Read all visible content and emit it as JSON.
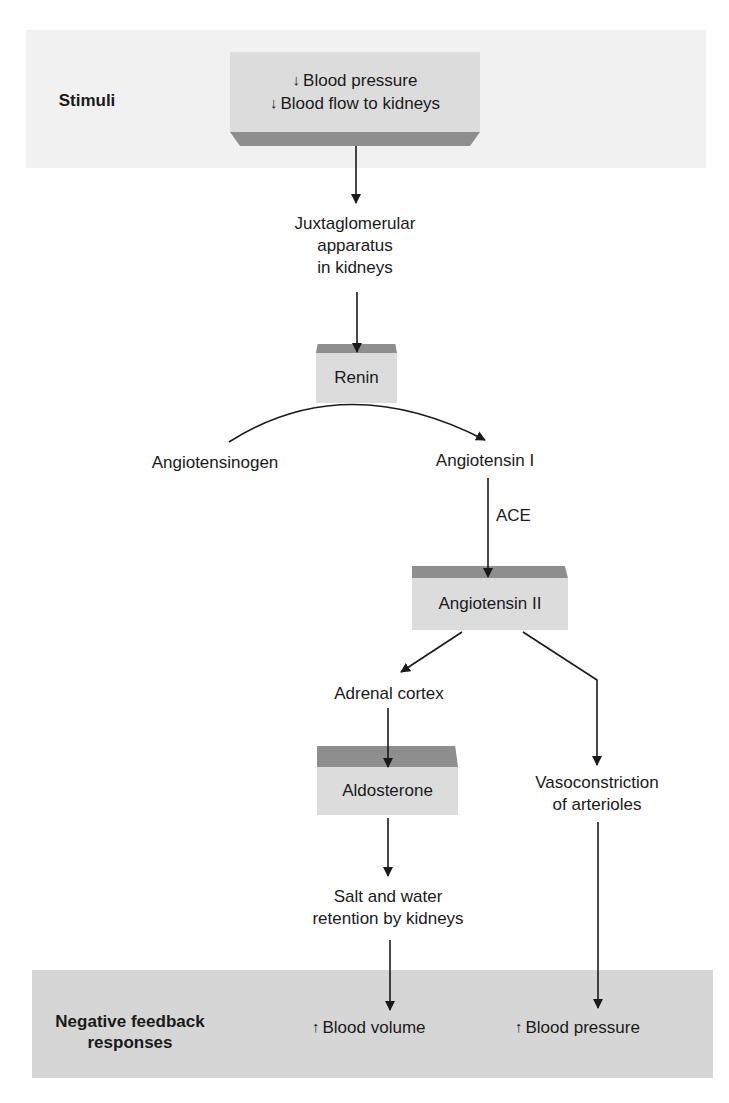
{
  "stimuli": {
    "band_label": "Stimuli",
    "lines": [
      {
        "arrow": "↓",
        "text": "Blood pressure"
      },
      {
        "arrow": "↓",
        "text": "Blood flow to kidneys"
      }
    ]
  },
  "nodes": {
    "juxtaglomerular": [
      "Juxtaglomerular",
      "apparatus",
      "in kidneys"
    ],
    "renin": "Renin",
    "angiotensinogen": "Angiotensinogen",
    "angiotensin_1": "Angiotensin I",
    "ace": "ACE",
    "angiotensin_2": "Angiotensin II",
    "adrenal_cortex": "Adrenal cortex",
    "aldosterone": "Aldosterone",
    "vasoconstriction": [
      "Vasoconstriction",
      "of arterioles"
    ],
    "salt_water": [
      "Salt and water",
      "retention by kidneys"
    ]
  },
  "responses": {
    "band_label": [
      "Negative feedback",
      "responses"
    ],
    "items": [
      {
        "arrow": "↑",
        "text": "Blood volume"
      },
      {
        "arrow": "↑",
        "text": "Blood pressure"
      }
    ]
  },
  "colors": {
    "top_band": "#f1f1f1",
    "bottom_band": "#d6d6d6",
    "box_face": "#dcdcdc",
    "box_bevel": "#8e8e8e",
    "line": "#1a1a1a"
  }
}
